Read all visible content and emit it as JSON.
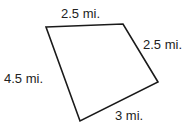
{
  "diagram": {
    "shape": "quadrilateral",
    "stroke_color": "#1a1a1a",
    "sides": [
      {
        "name": "top",
        "label": "2.5 mi."
      },
      {
        "name": "right",
        "label": "2.5 mi."
      },
      {
        "name": "bottom",
        "label": "3 mi."
      },
      {
        "name": "left",
        "label": "4.5 mi."
      }
    ]
  }
}
